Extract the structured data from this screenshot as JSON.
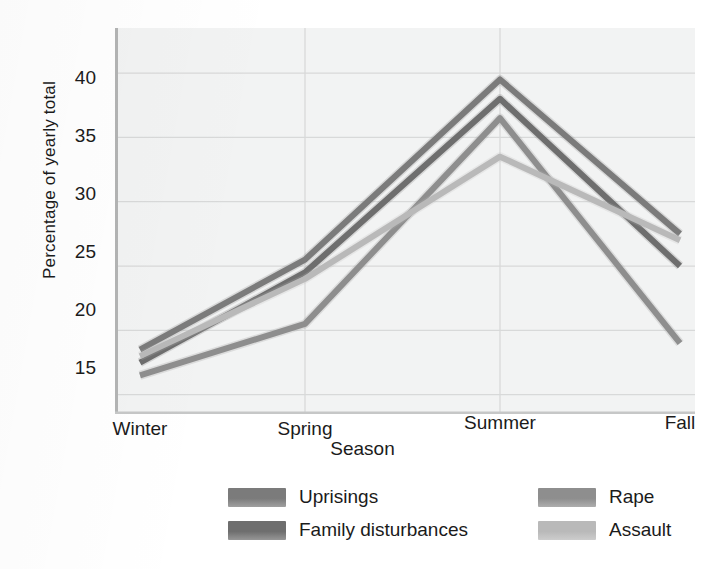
{
  "chart_data": {
    "type": "line",
    "title": "",
    "xlabel": "Season",
    "ylabel": "Percentage of yearly total",
    "categories": [
      "Winter",
      "Spring",
      "Summer",
      "Fall"
    ],
    "ylim": [
      13.5,
      43.5
    ],
    "yticks": [
      15,
      20,
      25,
      30,
      35,
      40
    ],
    "ytick_labels": [
      "15",
      "20",
      "25",
      "30",
      "35",
      "40"
    ],
    "grid": true,
    "legend_position": "bottom",
    "series": [
      {
        "name": "Uprisings",
        "values": [
          18.5,
          25.5,
          39.5,
          27.5
        ],
        "color": "#7b7b7b"
      },
      {
        "name": "Family disturbances",
        "values": [
          17.5,
          24.5,
          38.0,
          25.0
        ],
        "color": "#6e6e6e"
      },
      {
        "name": "Rape",
        "values": [
          16.5,
          20.5,
          36.5,
          19.0
        ],
        "color": "#8e8e8e"
      },
      {
        "name": "Assault",
        "values": [
          18.0,
          24.0,
          33.5,
          27.0
        ],
        "color": "#b9b9b9"
      }
    ]
  },
  "axes": {
    "y_title": "Percentage of yearly total",
    "x_title": "Season",
    "y_tick_15": "15",
    "y_tick_20": "20",
    "y_tick_25": "25",
    "y_tick_30": "30",
    "y_tick_35": "35",
    "y_tick_40": "40",
    "x_tick_winter": "Winter",
    "x_tick_spring": "Spring",
    "x_tick_summer": "Summer",
    "x_tick_fall": "Fall"
  },
  "legend": {
    "uprisings": "Uprisings",
    "family_disturbances": "Family disturbances",
    "rape": "Rape",
    "assault": "Assault"
  },
  "colors": {
    "plot_background": "#f2f3f3",
    "grid": "#d8d9d9",
    "axis_text": "#1b1b1b",
    "uprisings": "#7b7b7b",
    "family_disturbances": "#6e6e6e",
    "rape": "#8e8e8e",
    "assault": "#b9b9b9"
  }
}
